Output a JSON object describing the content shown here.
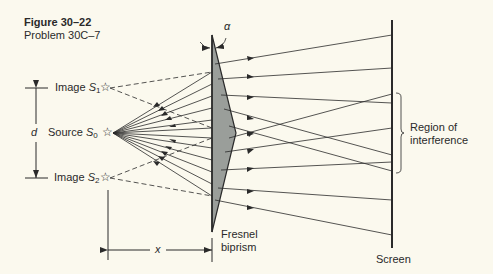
{
  "figure": {
    "title": "Figure 30–22",
    "subtitle": "Problem 30C–7"
  },
  "labels": {
    "image_s1": {
      "text": "Image ",
      "symbol": "S",
      "sub": "1"
    },
    "source_s0": {
      "text": "Source ",
      "symbol": "S",
      "sub": "0"
    },
    "image_s2": {
      "text": "Image ",
      "symbol": "S",
      "sub": "2"
    },
    "d": "d",
    "x": "x",
    "alpha": "α",
    "biprism_line1": "Fresnel",
    "biprism_line2": "biprism",
    "screen": "Screen",
    "region_line1": "Region of",
    "region_line2": "interference"
  },
  "icons": {
    "star": "☆"
  },
  "colors": {
    "background": "#fbf9ee",
    "ink": "#2a2a2a",
    "prism_fill": "#9a9e9a"
  }
}
